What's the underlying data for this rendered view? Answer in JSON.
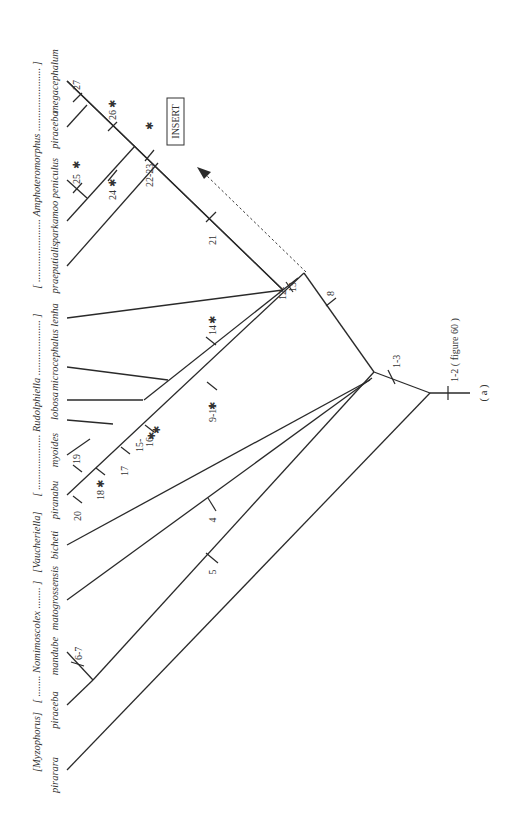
{
  "figure": {
    "panel_label": "( a )",
    "root_label": "1-2 ( figure 60 )",
    "insert_label": "INSERT"
  },
  "groups": [
    {
      "id": "myzophorus",
      "label": "[Myzophorus]"
    },
    {
      "id": "nomimoscolex",
      "label": "[ ........ Nomimoscolex ........ ]"
    },
    {
      "id": "vaucheriella",
      "label": "[Vaucheriella]"
    },
    {
      "id": "rudolphiella",
      "label": "[ ..................... Rudolphiella ..................... ]"
    },
    {
      "id": "amphoteromorphus",
      "label": "[ ........................ Amphoteromorphus ........................ ]"
    }
  ],
  "taxa": [
    {
      "name": "pirarara"
    },
    {
      "name": "piraeeba"
    },
    {
      "name": "mandube"
    },
    {
      "name": "matogrossensis"
    },
    {
      "name": "bicheti"
    },
    {
      "name": "piranabu"
    },
    {
      "name": "myoides"
    },
    {
      "name": "lobosa"
    },
    {
      "name": "microcephalus"
    },
    {
      "name": "lenha"
    },
    {
      "name": "praeputialis"
    },
    {
      "name": "parkamoo"
    },
    {
      "name": "peniculus"
    },
    {
      "name": "piraeeba"
    },
    {
      "name": "megacephalum"
    }
  ],
  "characters": {
    "c1_2": "1-2 ( figure 60 )",
    "c1_3": "1-3",
    "c4": "4",
    "c5": "5",
    "c6_7": "6-7",
    "c8": "8",
    "c9_11": "9-11",
    "c12_13a": "12-",
    "c12_13b": "13",
    "c14": "14",
    "c15_16a": "15-",
    "c15_16b": "16",
    "c17": "17",
    "c18": "18",
    "c19": "19",
    "c20": "20",
    "c21": "21",
    "c22_23": "22-23",
    "c24": "24",
    "c25": "25",
    "c26": "26",
    "c27": "27",
    "star": "✱"
  }
}
